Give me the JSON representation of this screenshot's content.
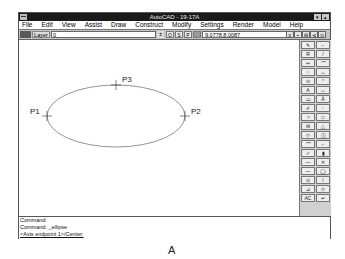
{
  "window": {
    "title": "AutoCAD - 19-17A",
    "minimize_label": "▾",
    "maximize_label": "▴"
  },
  "menubar": {
    "items": [
      {
        "label": "File"
      },
      {
        "label": "Edit"
      },
      {
        "label": "View"
      },
      {
        "label": "Assist"
      },
      {
        "label": "Draw"
      },
      {
        "label": "Construct"
      },
      {
        "label": "Modify"
      },
      {
        "label": "Settings"
      },
      {
        "label": "Render"
      },
      {
        "label": "Model"
      },
      {
        "label": "Help"
      }
    ]
  },
  "toolbar": {
    "layer_label": "Layer",
    "layer_value": "0",
    "layer_dropdown": "±",
    "ortho_label": "O",
    "snap_label": "S",
    "paper_label": "P",
    "coordinates": "9.0778,8.0087",
    "tools": [
      "≡",
      "▪",
      "⊟",
      "⊲",
      "⊙"
    ]
  },
  "drawing": {
    "shape": "ellipse",
    "points": [
      {
        "label": "P1",
        "x": 57,
        "y": 115
      },
      {
        "label": "P2",
        "x": 212,
        "y": 115
      },
      {
        "label": "P3",
        "x": 143,
        "y": 85
      }
    ]
  },
  "toolbox": {
    "buttons": [
      "✎",
      "⌐",
      "R",
      "/",
      "↩",
      "⌒",
      "○",
      "⌓",
      "⊙",
      "⌃",
      "A",
      "↔",
      "▭",
      "Å",
      "✐",
      "◦",
      "⌗",
      "□",
      "⊟",
      "△",
      "◇",
      "◫",
      "⌒",
      "⌐",
      "✓",
      "▮",
      "—",
      "✕",
      "—",
      "◯",
      "⊙",
      "/",
      "⊿",
      "◇",
      "AC",
      "↵"
    ]
  },
  "command": {
    "lines": [
      "Command:",
      "Command: _ellipse",
      "<Axis endpoint 1>/Center:"
    ]
  },
  "caption": "A"
}
